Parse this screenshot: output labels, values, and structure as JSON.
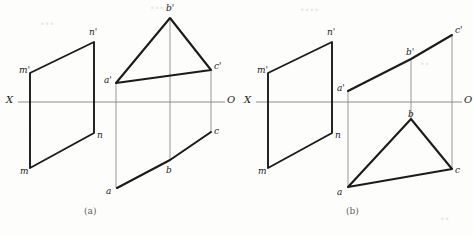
{
  "figure": {
    "stroke_color": "#1b1b1b",
    "axis_color": "#8d8d8d",
    "background": "#fdfdfc",
    "width": 473,
    "height": 236
  },
  "panels": [
    {
      "id": "a",
      "caption": "(a)",
      "caption_pos": {
        "x": 84,
        "y": 207
      },
      "axis": {
        "name": "ground-line",
        "x_label": "X",
        "o_label": "O",
        "x_label_pos": {
          "x": 6,
          "y": 95
        },
        "o_label_pos": {
          "x": 227,
          "y": 95
        },
        "y": 102,
        "x1": 18,
        "x2": 225
      },
      "parallelogram": {
        "name": "plane-mn",
        "points": "30,73 94,42 94,133 30,168",
        "vertices": [
          {
            "label": "m'",
            "x": 30,
            "y": 73,
            "label_x": 19,
            "label_y": 66
          },
          {
            "label": "n'",
            "x": 94,
            "y": 42,
            "label_x": 89,
            "label_y": 28
          },
          {
            "label": "n",
            "x": 94,
            "y": 133,
            "label_x": 97,
            "label_y": 131
          },
          {
            "label": "m",
            "x": 30,
            "y": 168,
            "label_x": 20,
            "label_y": 167
          }
        ]
      },
      "front_view": {
        "name": "triangle-front-view",
        "shape": "triangle",
        "points": "116,83 170,18 211,70",
        "vertices": [
          {
            "label": "a'",
            "x": 116,
            "y": 83,
            "label_x": 104,
            "label_y": 76
          },
          {
            "label": "b'",
            "x": 170,
            "y": 18,
            "label_x": 166,
            "label_y": 4
          },
          {
            "label": "c'",
            "x": 211,
            "y": 70,
            "label_x": 214,
            "label_y": 62
          }
        ]
      },
      "top_view": {
        "name": "triangle-top-view",
        "shape": "edge-line",
        "points": "117,188 170,160 211,132",
        "vertices": [
          {
            "label": "a",
            "x": 117,
            "y": 188,
            "label_x": 106,
            "label_y": 187
          },
          {
            "label": "b",
            "x": 170,
            "y": 160,
            "label_x": 166,
            "label_y": 166
          },
          {
            "label": "c",
            "x": 211,
            "y": 132,
            "label_x": 214,
            "label_y": 127
          }
        ]
      },
      "projectors": [
        {
          "name": "projector-a",
          "x": 116,
          "y1": 83,
          "y2": 188
        },
        {
          "name": "projector-b",
          "x": 170,
          "y1": 18,
          "y2": 160
        },
        {
          "name": "projector-c",
          "x": 211,
          "y1": 70,
          "y2": 132
        }
      ]
    },
    {
      "id": "b",
      "caption": "(b)",
      "caption_pos": {
        "x": 346,
        "y": 207
      },
      "axis": {
        "name": "ground-line",
        "x_label": "X",
        "o_label": "O",
        "x_label_pos": {
          "x": 244,
          "y": 95
        },
        "o_label_pos": {
          "x": 464,
          "y": 95
        },
        "y": 102,
        "x1": 256,
        "x2": 462
      },
      "parallelogram": {
        "name": "plane-mn",
        "points": "268,73 332,42 332,133 268,168",
        "vertices": [
          {
            "label": "m'",
            "x": 268,
            "y": 73,
            "label_x": 257,
            "label_y": 66
          },
          {
            "label": "n'",
            "x": 332,
            "y": 42,
            "label_x": 327,
            "label_y": 28
          },
          {
            "label": "n",
            "x": 332,
            "y": 133,
            "label_x": 335,
            "label_y": 131
          },
          {
            "label": "m",
            "x": 268,
            "y": 168,
            "label_x": 258,
            "label_y": 167
          }
        ]
      },
      "front_view": {
        "name": "triangle-front-view",
        "shape": "edge-line",
        "points": "348,91 411,59 452,35",
        "vertices": [
          {
            "label": "a'",
            "x": 348,
            "y": 91,
            "label_x": 337,
            "label_y": 84
          },
          {
            "label": "b'",
            "x": 411,
            "y": 59,
            "label_x": 406,
            "label_y": 48
          },
          {
            "label": "c'",
            "x": 452,
            "y": 35,
            "label_x": 455,
            "label_y": 26
          }
        ]
      },
      "top_view": {
        "name": "triangle-top-view",
        "shape": "triangle",
        "points": "348,187 411,119 452,169",
        "vertices": [
          {
            "label": "a",
            "x": 348,
            "y": 187,
            "label_x": 337,
            "label_y": 188
          },
          {
            "label": "b",
            "x": 411,
            "y": 119,
            "label_x": 408,
            "label_y": 110
          },
          {
            "label": "c",
            "x": 452,
            "y": 169,
            "label_x": 455,
            "label_y": 166
          }
        ]
      },
      "projectors": [
        {
          "name": "projector-a",
          "x": 348,
          "y1": 91,
          "y2": 187
        },
        {
          "name": "projector-b",
          "x": 411,
          "y1": 59,
          "y2": 119
        },
        {
          "name": "projector-c",
          "x": 452,
          "y1": 35,
          "y2": 169
        }
      ]
    }
  ]
}
